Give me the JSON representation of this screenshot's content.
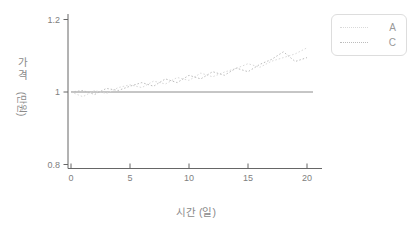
{
  "chart_data": {
    "type": "line",
    "title": "",
    "xlabel": "시간 (일)",
    "ylabel": "가격 (만원)",
    "ylabel_main": "가격",
    "ylabel_unit": "(만원)",
    "x": [
      0,
      1,
      2,
      3,
      4,
      5,
      6,
      7,
      8,
      9,
      10,
      11,
      12,
      13,
      14,
      15,
      16,
      17,
      18,
      19,
      20
    ],
    "series": [
      {
        "name": "A",
        "color": "#d9d9d9",
        "values": [
          1.0,
          0.987,
          1.004,
          0.996,
          1.012,
          1.02,
          1.012,
          1.03,
          1.022,
          1.04,
          1.032,
          1.052,
          1.042,
          1.055,
          1.065,
          1.078,
          1.068,
          1.085,
          1.095,
          1.105,
          1.122
        ]
      },
      {
        "name": "C",
        "color": "#bcbcbc",
        "values": [
          1.0,
          1.004,
          0.993,
          1.01,
          1.004,
          1.016,
          1.026,
          1.016,
          1.036,
          1.026,
          1.046,
          1.036,
          1.056,
          1.046,
          1.066,
          1.056,
          1.076,
          1.09,
          1.111,
          1.084,
          1.095
        ]
      }
    ],
    "reference_line": {
      "y": 1.0,
      "color": "#8c8c8c"
    },
    "xlim": [
      0,
      20
    ],
    "ylim": [
      0.8,
      1.2
    ],
    "xticks": [
      0,
      5,
      10,
      15,
      20
    ],
    "yticks": [
      0.8,
      1,
      1.2
    ],
    "grid": false,
    "legend_position": "top-right",
    "axis_color": "#666666",
    "tick_color": "#808080",
    "label_color": "#8a8a8a"
  }
}
